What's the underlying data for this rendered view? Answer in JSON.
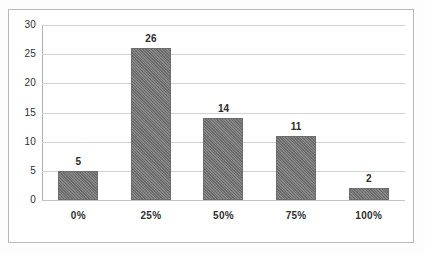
{
  "chart_data": {
    "type": "bar",
    "title": "",
    "subtitle": "",
    "xlabel": "",
    "ylabel": "",
    "categories": [
      "0%",
      "25%",
      "50%",
      "75%",
      "100%"
    ],
    "values": [
      5,
      26,
      14,
      11,
      2
    ],
    "data_labels": [
      "5",
      "26",
      "14",
      "11",
      "2"
    ],
    "ylim": [
      0,
      30
    ],
    "ytick_labels": [
      "0",
      "5",
      "10",
      "15",
      "20",
      "25",
      "30"
    ],
    "ytick_values": [
      0,
      5,
      10,
      15,
      20,
      25,
      30
    ],
    "grid": "horizontal",
    "legend": "none",
    "bar_color": "#757575",
    "gridline_color": "#d2d2d2",
    "axis_color": "#b0b0b0",
    "frame_color": "#b9b9b9",
    "background_color": "#ffffff"
  }
}
